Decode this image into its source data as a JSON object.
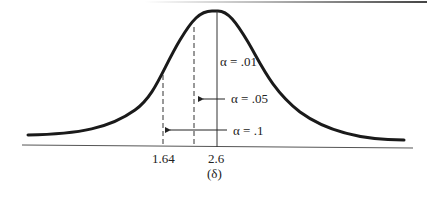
{
  "figure": {
    "type": "normal-distribution-diagram",
    "x_axis_label": "(δ)",
    "tick_labels": [
      "1.64",
      "2.6"
    ],
    "markers": [
      {
        "label": "α = .01",
        "style": "solid",
        "position": "2.6"
      },
      {
        "label": "α = .05",
        "style": "dashed",
        "arrow": "left"
      },
      {
        "label": "α = .1",
        "style": "dashed",
        "arrow": "left",
        "position": "1.64"
      }
    ]
  },
  "labels": {
    "alpha_01": "α = .01",
    "alpha_05": "α = .05",
    "alpha_1": "α = .1",
    "tick_164": "1.64",
    "tick_26": "2.6",
    "axis": "(δ)"
  },
  "colors": {
    "curve": "#1a1a1a",
    "axis": "#555555",
    "text": "#222222"
  }
}
